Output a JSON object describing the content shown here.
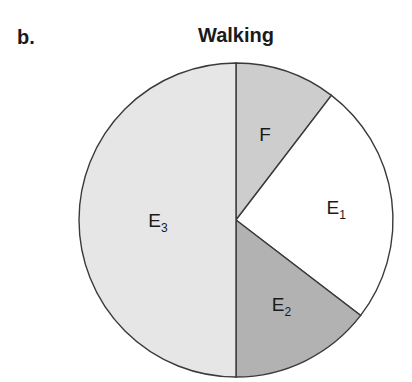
{
  "panel_label": "b.",
  "chart_data": {
    "type": "pie",
    "title": "Walking",
    "start_angle_deg": 0,
    "direction": "clockwise",
    "slices": [
      {
        "label": "F",
        "base": "F",
        "sub": "",
        "value": 10.4,
        "color": "#cdcdcd"
      },
      {
        "label": "E1",
        "base": "E",
        "sub": "1",
        "value": 25.0,
        "color": "#ffffff"
      },
      {
        "label": "E2",
        "base": "E",
        "sub": "2",
        "value": 14.6,
        "color": "#b2b2b2"
      },
      {
        "label": "E3",
        "base": "E",
        "sub": "3",
        "value": 50.0,
        "color": "#e6e6e6"
      }
    ],
    "legend": null,
    "units": "percent (estimated from slice angles)"
  }
}
